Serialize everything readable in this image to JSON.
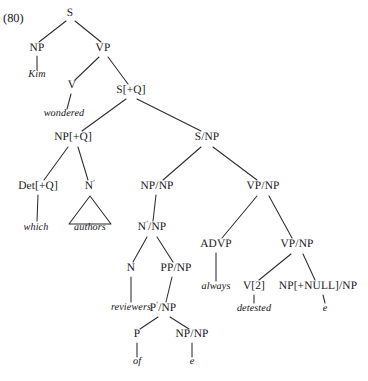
{
  "figure": {
    "example_number": "(80)",
    "sentence": "Kim wondered which authors reviewers of e always detested e",
    "background_color": "#ffffff",
    "line_color": "#2b2b33",
    "text_color": "#16161a"
  },
  "nodes": {
    "s_root": {
      "label": "S",
      "x": 70,
      "y": 16
    },
    "np_subj": {
      "label": "NP",
      "x": 37,
      "y": 51
    },
    "vp_main": {
      "label": "VP",
      "x": 103,
      "y": 51
    },
    "v_main": {
      "label": "V",
      "x": 72,
      "y": 88
    },
    "s_plus_q": {
      "label": "S[+Q]",
      "x": 131,
      "y": 93
    },
    "np_plus_q": {
      "label": "NP[+Q]",
      "x": 73,
      "y": 140
    },
    "s_slash_np": {
      "label": "S/NP",
      "x": 207,
      "y": 140
    },
    "det_plus_q": {
      "label": "Det[+Q]",
      "x": 38,
      "y": 189
    },
    "nbar_authors": {
      "label": "N",
      "x": 90,
      "y": 189,
      "prime": true
    },
    "np_slash_np_1": {
      "label": "NP/NP",
      "x": 157,
      "y": 189
    },
    "vp_slash_np_1": {
      "label": "VP/NP",
      "x": 263,
      "y": 189
    },
    "nbar_slash_np": {
      "label": "N",
      "x": 152,
      "y": 230,
      "prime": true,
      "slash": "/NP"
    },
    "advp": {
      "label": "ADVP",
      "x": 216,
      "y": 247
    },
    "vp_slash_np_2": {
      "label": "VP/NP",
      "x": 297,
      "y": 247
    },
    "n_reviewers": {
      "label": "N",
      "x": 131,
      "y": 271
    },
    "pp_slash_np": {
      "label": "PP/NP",
      "x": 176,
      "y": 271
    },
    "v_2": {
      "label": "V[2]",
      "x": 254,
      "y": 289
    },
    "np_null_slash": {
      "label": "NP[+NULL]/NP",
      "x": 318,
      "y": 289
    },
    "pbar_slash_np": {
      "label": "P",
      "x": 163,
      "y": 311,
      "prime": true,
      "slash": "/NP"
    },
    "p_of": {
      "label": "P",
      "x": 137,
      "y": 337
    },
    "np_slash_np_2": {
      "label": "NP/NP",
      "x": 192,
      "y": 337
    }
  },
  "terminals": {
    "kim": {
      "label": "Kim",
      "x": 37,
      "y": 77
    },
    "wondered": {
      "label": "wondered",
      "x": 64,
      "y": 116
    },
    "which": {
      "label": "which",
      "x": 36,
      "y": 230
    },
    "authors": {
      "label": "authors",
      "x": 90,
      "y": 230
    },
    "reviewers": {
      "label": "reviewers",
      "x": 131,
      "y": 310
    },
    "always": {
      "label": "always",
      "x": 216,
      "y": 289
    },
    "detested": {
      "label": "detested",
      "x": 254,
      "y": 311
    },
    "e_pp": {
      "label": "e",
      "x": 192,
      "y": 364
    },
    "e_obj": {
      "label": "e",
      "x": 325,
      "y": 311
    },
    "of": {
      "label": "of",
      "x": 137,
      "y": 364
    }
  },
  "edges": [
    {
      "from": "s_root",
      "to": "np_subj",
      "x1": 66,
      "y1": 21,
      "x2": 39,
      "y2": 42
    },
    {
      "from": "s_root",
      "to": "vp_main",
      "x1": 75,
      "y1": 21,
      "x2": 101,
      "y2": 42
    },
    {
      "from": "np_subj",
      "to": "kim",
      "x1": 37,
      "y1": 56,
      "x2": 37,
      "y2": 70
    },
    {
      "from": "vp_main",
      "to": "v_main",
      "x1": 99,
      "y1": 57,
      "x2": 75,
      "y2": 80
    },
    {
      "from": "vp_main",
      "to": "s_plus_q",
      "x1": 108,
      "y1": 57,
      "x2": 128,
      "y2": 84
    },
    {
      "from": "v_main",
      "to": "wondered",
      "x1": 71,
      "y1": 94,
      "x2": 67,
      "y2": 109
    },
    {
      "from": "s_plus_q",
      "to": "np_plus_q",
      "x1": 126,
      "y1": 99,
      "x2": 82,
      "y2": 131
    },
    {
      "from": "s_plus_q",
      "to": "s_slash_np",
      "x1": 137,
      "y1": 99,
      "x2": 201,
      "y2": 131
    },
    {
      "from": "np_plus_q",
      "to": "det_plus_q",
      "x1": 68,
      "y1": 147,
      "x2": 44,
      "y2": 180
    },
    {
      "from": "np_plus_q",
      "to": "nbar_authors",
      "x1": 78,
      "y1": 147,
      "x2": 88,
      "y2": 180
    },
    {
      "from": "det_plus_q",
      "to": "which",
      "x1": 38,
      "y1": 195,
      "x2": 37,
      "y2": 221
    },
    {
      "from": "s_slash_np",
      "to": "np_slash_np_1",
      "x1": 201,
      "y1": 147,
      "x2": 163,
      "y2": 180
    },
    {
      "from": "s_slash_np",
      "to": "vp_slash_np_1",
      "x1": 213,
      "y1": 147,
      "x2": 257,
      "y2": 180
    },
    {
      "from": "np_slash_np_1",
      "to": "nbar_slash_np",
      "x1": 156,
      "y1": 195,
      "x2": 153,
      "y2": 221
    },
    {
      "from": "vp_slash_np_1",
      "to": "advp",
      "x1": 257,
      "y1": 196,
      "x2": 222,
      "y2": 238
    },
    {
      "from": "vp_slash_np_1",
      "to": "vp_slash_np_2",
      "x1": 269,
      "y1": 196,
      "x2": 292,
      "y2": 238
    },
    {
      "from": "nbar_slash_np",
      "to": "n_reviewers",
      "x1": 147,
      "y1": 237,
      "x2": 133,
      "y2": 262
    },
    {
      "from": "nbar_slash_np",
      "to": "pp_slash_np",
      "x1": 157,
      "y1": 237,
      "x2": 173,
      "y2": 262
    },
    {
      "from": "advp",
      "to": "always",
      "x1": 216,
      "y1": 253,
      "x2": 216,
      "y2": 281
    },
    {
      "from": "vp_slash_np_2",
      "to": "v_2",
      "x1": 291,
      "y1": 254,
      "x2": 259,
      "y2": 280
    },
    {
      "from": "vp_slash_np_2",
      "to": "np_null_slash",
      "x1": 303,
      "y1": 254,
      "x2": 315,
      "y2": 280
    },
    {
      "from": "n_reviewers",
      "to": "reviewers",
      "x1": 131,
      "y1": 277,
      "x2": 131,
      "y2": 302
    },
    {
      "from": "pp_slash_np",
      "to": "pbar_slash_np",
      "x1": 172,
      "y1": 277,
      "x2": 166,
      "y2": 302
    },
    {
      "from": "v_2",
      "to": "detested",
      "x1": 254,
      "y1": 295,
      "x2": 254,
      "y2": 303
    },
    {
      "from": "np_null_slash",
      "to": "e_obj",
      "x1": 323,
      "y1": 295,
      "x2": 325,
      "y2": 303
    },
    {
      "from": "pbar_slash_np",
      "to": "p_of",
      "x1": 158,
      "y1": 317,
      "x2": 140,
      "y2": 329
    },
    {
      "from": "pbar_slash_np",
      "to": "np_slash_np_2",
      "x1": 170,
      "y1": 317,
      "x2": 189,
      "y2": 329
    },
    {
      "from": "p_of",
      "to": "of",
      "x1": 137,
      "y1": 343,
      "x2": 137,
      "y2": 357
    },
    {
      "from": "np_slash_np_2",
      "to": "e_pp",
      "x1": 192,
      "y1": 343,
      "x2": 192,
      "y2": 357
    }
  ],
  "triangles": [
    {
      "name": "authors-triangle",
      "apex_x": 90,
      "apex_y": 196,
      "left_x": 69,
      "right_x": 111,
      "base_y": 224
    }
  ]
}
